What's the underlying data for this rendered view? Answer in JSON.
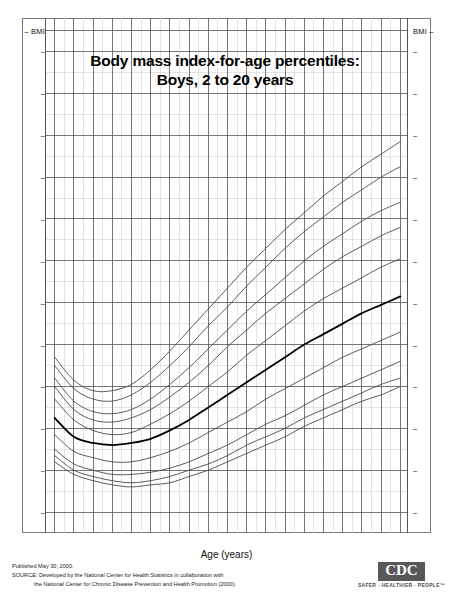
{
  "title": {
    "line1": "Body mass index-for-age percentiles:",
    "line2": "Boys, 2 to 20 years"
  },
  "axes": {
    "y_label_top_left": "BMI",
    "y_label_top_right": "BMI",
    "y_unit_left": "kg/m²",
    "y_unit_right": "kg/m²",
    "x_title": "Age (years)",
    "y_ticks": [
      34,
      32,
      30,
      28,
      26,
      24,
      22,
      20,
      18,
      16,
      14,
      12
    ],
    "x_ticks": [
      2,
      3,
      4,
      5,
      6,
      7,
      8,
      9,
      10,
      11,
      12,
      13,
      14,
      15,
      16,
      17,
      18,
      19,
      20
    ],
    "ylim": [
      11,
      35.6
    ],
    "xlim": [
      1.55,
      20.45
    ]
  },
  "percentile_labels": [
    "97th",
    "95th",
    "90th",
    "85th",
    "75th",
    "50th",
    "25th",
    "10th",
    "5th",
    "3rd"
  ],
  "footer": {
    "published": "Published May 30, 2000.",
    "source_line1": "SOURCE: Developed by the National Center for Health Statistics in collaboration with",
    "source_line2": "the National Center for Chronic Disease Prevention and Health Promotion (2000).",
    "logo_text": "CDC",
    "logo_tagline": "SAFER · HEALTHIER · PEOPLE™"
  },
  "colors": {
    "curve": "#4a4a4a",
    "curve_median": "#000000",
    "grid_major": "#555555",
    "grid_minor": "#d8d8d8",
    "frame": "#7a7a7a",
    "logo": "#58585a"
  },
  "chart_data": {
    "type": "line",
    "title": "Body mass index-for-age percentiles: Boys, 2 to 20 years",
    "xlabel": "Age (years)",
    "ylabel": "BMI",
    "xlim": [
      1.55,
      20.45
    ],
    "ylim": [
      11,
      35.6
    ],
    "grid": true,
    "legend": "right-of-plot (curve end labels)",
    "x": [
      2,
      3,
      4,
      5,
      6,
      7,
      8,
      9,
      10,
      11,
      12,
      13,
      14,
      15,
      16,
      17,
      18,
      19,
      20
    ],
    "series": [
      {
        "name": "97th",
        "values": [
          19.4,
          18.3,
          17.8,
          17.8,
          18.1,
          18.8,
          19.7,
          20.7,
          21.7,
          22.7,
          23.7,
          24.6,
          25.5,
          26.3,
          27.1,
          27.8,
          28.5,
          29.1,
          29.7
        ]
      },
      {
        "name": "95th",
        "values": [
          19.0,
          17.9,
          17.4,
          17.3,
          17.6,
          18.2,
          19.0,
          19.9,
          20.9,
          21.8,
          22.8,
          23.7,
          24.6,
          25.4,
          26.1,
          26.8,
          27.4,
          28.0,
          28.5
        ]
      },
      {
        "name": "90th",
        "values": [
          18.4,
          17.3,
          16.8,
          16.7,
          16.9,
          17.4,
          18.1,
          18.9,
          19.8,
          20.7,
          21.6,
          22.4,
          23.2,
          24.0,
          24.7,
          25.3,
          25.9,
          26.4,
          26.8
        ]
      },
      {
        "name": "85th",
        "values": [
          18.0,
          16.9,
          16.4,
          16.3,
          16.5,
          16.9,
          17.5,
          18.2,
          19.0,
          19.9,
          20.7,
          21.5,
          22.2,
          22.9,
          23.6,
          24.2,
          24.7,
          25.2,
          25.6
        ]
      },
      {
        "name": "75th",
        "values": [
          17.4,
          16.4,
          15.9,
          15.7,
          15.8,
          16.2,
          16.7,
          17.3,
          18.0,
          18.7,
          19.5,
          20.2,
          20.9,
          21.6,
          22.2,
          22.7,
          23.2,
          23.7,
          24.1
        ]
      },
      {
        "name": "50th",
        "values": [
          16.5,
          15.6,
          15.3,
          15.2,
          15.3,
          15.5,
          15.9,
          16.4,
          17.0,
          17.6,
          18.2,
          18.8,
          19.4,
          20.0,
          20.5,
          21.0,
          21.5,
          21.9,
          22.3
        ]
      },
      {
        "name": "25th",
        "values": [
          15.7,
          14.9,
          14.6,
          14.4,
          14.4,
          14.6,
          14.9,
          15.3,
          15.8,
          16.3,
          16.8,
          17.4,
          17.9,
          18.4,
          18.9,
          19.4,
          19.8,
          20.2,
          20.6
        ]
      },
      {
        "name": "10th",
        "values": [
          15.0,
          14.3,
          14.0,
          13.8,
          13.8,
          13.9,
          14.1,
          14.4,
          14.8,
          15.2,
          15.7,
          16.2,
          16.6,
          17.1,
          17.6,
          18.0,
          18.4,
          18.8,
          19.2
        ]
      },
      {
        "name": "5th",
        "values": [
          14.7,
          14.0,
          13.7,
          13.5,
          13.4,
          13.5,
          13.7,
          14.0,
          14.3,
          14.7,
          15.2,
          15.6,
          16.0,
          16.5,
          16.9,
          17.3,
          17.7,
          18.1,
          18.4
        ]
      },
      {
        "name": "3rd",
        "values": [
          14.4,
          13.8,
          13.5,
          13.3,
          13.2,
          13.3,
          13.4,
          13.7,
          14.0,
          14.4,
          14.8,
          15.2,
          15.6,
          16.1,
          16.5,
          16.9,
          17.3,
          17.6,
          18.0
        ]
      }
    ]
  }
}
